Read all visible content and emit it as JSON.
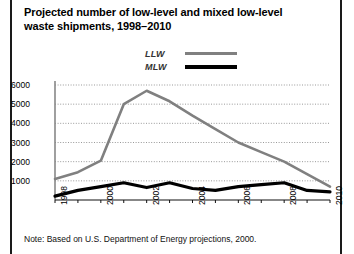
{
  "title": {
    "line1": "Projected number of low-level and mixed low-level",
    "line2": "waste shipments, 1998–2010"
  },
  "note": "Note: Based on U.S. Department of Energy projections, 2000.",
  "colors": {
    "llw": "#808080",
    "mlw": "#000000",
    "grid": "#999999",
    "axis": "#888888",
    "rule": "#1a1a1a"
  },
  "chart_data": {
    "type": "line",
    "title": "Projected number of low-level and mixed low-level waste shipments, 1998–2010",
    "xlabel": "",
    "ylabel": "",
    "grid": true,
    "legend_position": "top-center",
    "xlim": [
      1998,
      2010
    ],
    "ylim": [
      0,
      6000
    ],
    "yticks": [
      1000,
      2000,
      3000,
      4000,
      5000,
      6000
    ],
    "ytick_labels": [
      "1000",
      "2000",
      "3000",
      "4000",
      "5000",
      "6000"
    ],
    "xticks": [
      1998,
      1999,
      2000,
      2001,
      2002,
      2003,
      2004,
      2005,
      2006,
      2007,
      2008,
      2009,
      2010
    ],
    "xtick_labels": [
      "1998",
      "",
      "2000",
      "",
      "2002",
      "",
      "2004",
      "",
      "2006",
      "",
      "2008",
      "",
      "2010"
    ],
    "x": [
      1998,
      1999,
      2000,
      2001,
      2002,
      2003,
      2004,
      2005,
      2006,
      2007,
      2008,
      2009,
      2010
    ],
    "series": [
      {
        "name": "LLW",
        "color": "#808080",
        "values": [
          1100,
          1450,
          2050,
          5000,
          5700,
          5150,
          4400,
          3700,
          3000,
          2500,
          2000,
          1350,
          700
        ]
      },
      {
        "name": "MLW",
        "color": "#000000",
        "values": [
          200,
          500,
          700,
          900,
          650,
          900,
          600,
          500,
          700,
          800,
          900,
          500,
          420
        ]
      }
    ],
    "annotations": [
      "Note: Based on U.S. Department of Energy projections, 2000."
    ]
  }
}
